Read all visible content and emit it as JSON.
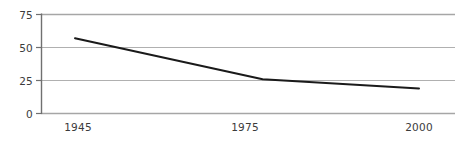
{
  "chart_data": {
    "type": "line",
    "title": "",
    "subtitle": "",
    "xlabel": "",
    "ylabel": "",
    "x": [
      1945,
      1975,
      2000
    ],
    "values": [
      57,
      26,
      19
    ],
    "series": [
      {
        "name": "",
        "values": [
          57,
          26,
          19
        ]
      }
    ],
    "xlim": [
      1945,
      2000
    ],
    "ylim": [
      0,
      75
    ],
    "x_tick_labels": [
      "1945",
      "1975",
      "2000"
    ],
    "y_tick_labels": [
      "0",
      "25",
      "50",
      "75"
    ],
    "y_ticks": [
      0,
      25,
      50,
      75
    ],
    "grid": "horizontal",
    "legend": "none",
    "annotations": [],
    "colors": {
      "line": "#1a1a1a",
      "grid": "#a8a8a8",
      "axis": "#6e6e6e",
      "text": "#3b3b3b",
      "background": "#ffffff"
    }
  },
  "axes": {
    "y": {
      "ticks": [
        {
          "label": "75",
          "value": 75
        },
        {
          "label": "50",
          "value": 50
        },
        {
          "label": "25",
          "value": 25
        },
        {
          "label": "0",
          "value": 0
        }
      ]
    },
    "x": {
      "ticks": [
        {
          "label": "1945",
          "value": 1945
        },
        {
          "label": "1975",
          "value": 1975
        },
        {
          "label": "2000",
          "value": 2000
        }
      ]
    }
  }
}
